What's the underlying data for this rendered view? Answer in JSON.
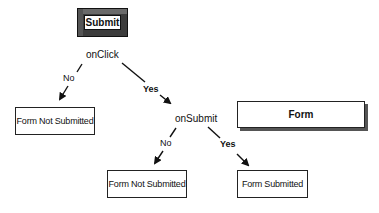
{
  "diagram": {
    "submit_button": {
      "label": "Submit"
    },
    "events": {
      "on_click": "onClick",
      "on_submit": "onSubmit"
    },
    "branches": {
      "click_no": "No",
      "click_yes": "Yes",
      "submit_no": "No",
      "submit_yes": "Yes"
    },
    "outcomes": {
      "click_no_result": "Form Not Submitted",
      "submit_no_result": "Form Not Submitted",
      "submit_yes_result": "Form Submitted"
    },
    "form_box": {
      "label": "Form"
    }
  }
}
